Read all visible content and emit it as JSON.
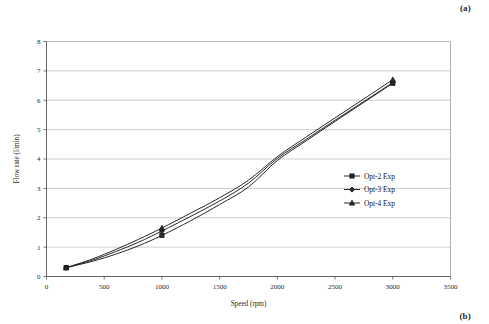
{
  "figure": {
    "panel_label_top": "(a)",
    "panel_label_bottom": "(b)"
  },
  "chart_data": {
    "type": "line",
    "title": "",
    "subtitle": "",
    "xlabel": "Speed (rpm)",
    "ylabel": "Flow rate (l/min)",
    "xlim": [
      0,
      3500
    ],
    "ylim": [
      0,
      8
    ],
    "xticks": [
      0,
      500,
      1000,
      1500,
      2000,
      2500,
      3000,
      3500
    ],
    "xtick_labels": [
      "0",
      "500",
      "1000",
      "1500",
      "2000",
      "2500",
      "3000",
      "3500"
    ],
    "yticks": [
      0,
      1,
      2,
      3,
      4,
      5,
      6,
      7,
      8
    ],
    "ytick_labels": [
      "0",
      "1",
      "2",
      "3",
      "4",
      "5",
      "6",
      "7",
      "8"
    ],
    "grid": "horizontal",
    "grid_color": "#b9b9b9",
    "legend_position": "center-right",
    "line_color": "#1c1c1c",
    "series": [
      {
        "name": "Opt-2 Exp",
        "marker": "square",
        "x": [
          170,
          1000,
          3000
        ],
        "values": [
          0.3,
          1.4,
          6.58
        ],
        "x_dense": [
          170,
          400,
          600,
          800,
          1000,
          1250,
          1500,
          1750,
          2000,
          2250,
          2500,
          2750,
          3000
        ],
        "values_dense": [
          0.3,
          0.52,
          0.76,
          1.05,
          1.4,
          1.9,
          2.45,
          3.05,
          3.95,
          4.62,
          5.28,
          5.93,
          6.58
        ]
      },
      {
        "name": "Opt-3 Exp",
        "marker": "diamond",
        "x": [
          170,
          1000,
          3000
        ],
        "values": [
          0.3,
          1.55,
          6.6
        ],
        "x_dense": [
          170,
          400,
          600,
          800,
          1000,
          1250,
          1500,
          1750,
          2000,
          2250,
          2500,
          2750,
          3000
        ],
        "values_dense": [
          0.3,
          0.56,
          0.85,
          1.17,
          1.55,
          2.05,
          2.57,
          3.18,
          4.02,
          4.67,
          5.32,
          5.96,
          6.6
        ]
      },
      {
        "name": "Opt-4 Exp",
        "marker": "triangle",
        "x": [
          170,
          1000,
          3000
        ],
        "values": [
          0.3,
          1.65,
          6.7
        ],
        "x_dense": [
          170,
          400,
          600,
          800,
          1000,
          1250,
          1500,
          1750,
          2000,
          2250,
          2500,
          2750,
          3000
        ],
        "values_dense": [
          0.3,
          0.6,
          0.92,
          1.27,
          1.65,
          2.16,
          2.68,
          3.28,
          4.08,
          4.75,
          5.4,
          6.05,
          6.7
        ]
      }
    ]
  },
  "legend": {
    "entries": [
      {
        "label": "Opt-2 Exp",
        "marker": "square"
      },
      {
        "label": "Opt-3 Exp",
        "marker": "diamond"
      },
      {
        "label": "Opt-4 Exp",
        "marker": "triangle"
      }
    ]
  }
}
